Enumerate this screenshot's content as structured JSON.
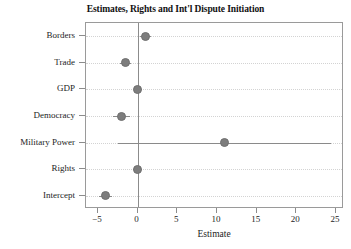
{
  "chart_data": {
    "type": "scatter",
    "title": "Estimates, Rights and Int'l Dispute Initiation",
    "xlabel": "Estimate",
    "ylabel": "",
    "xlim": [
      -6.5,
      26.0
    ],
    "xticks": [
      -5,
      0,
      5,
      10,
      15,
      20,
      25
    ],
    "xtick_labels": [
      "−5",
      "0",
      "5",
      "10",
      "15",
      "20",
      "25"
    ],
    "grid": "horizontal-dotted",
    "legend": "none",
    "reference_line": 0,
    "categories": [
      "Borders",
      "Trade",
      "GDP",
      "Democracy",
      "Military Power",
      "Rights",
      "Intercept"
    ],
    "values": [
      1.0,
      -1.5,
      0.0,
      -2.0,
      11.0,
      0.0,
      -4.0
    ],
    "ci_low": [
      0.3,
      -2.2,
      -0.5,
      -3.1,
      -2.5,
      -0.6,
      -4.9
    ],
    "ci_high": [
      1.7,
      -0.8,
      0.5,
      -1.0,
      24.4,
      0.6,
      -3.2
    ],
    "points": [
      {
        "label": "Borders",
        "estimate": 1.0,
        "ci_low": 0.3,
        "ci_high": 1.7
      },
      {
        "label": "Trade",
        "estimate": -1.5,
        "ci_low": -2.2,
        "ci_high": -0.8
      },
      {
        "label": "GDP",
        "estimate": 0.0,
        "ci_low": -0.5,
        "ci_high": 0.5
      },
      {
        "label": "Democracy",
        "estimate": -2.0,
        "ci_low": -3.1,
        "ci_high": -1.0
      },
      {
        "label": "Military Power",
        "estimate": 11.0,
        "ci_low": -2.5,
        "ci_high": 24.4
      },
      {
        "label": "Rights",
        "estimate": 0.0,
        "ci_low": -0.6,
        "ci_high": 0.6
      },
      {
        "label": "Intercept",
        "estimate": -4.0,
        "ci_low": -4.9,
        "ci_high": -3.2
      }
    ],
    "colors": {
      "marker": "#7d7d7d",
      "ci": "#8a8a8a",
      "axis": "#9a9a9a",
      "grid": "#d3d3d3",
      "zero_line": "#8c8c8c",
      "text": "#1c1c1c",
      "background": "#ffffff"
    }
  }
}
